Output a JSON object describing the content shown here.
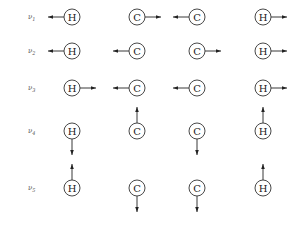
{
  "atoms": [
    "H",
    "C",
    "C",
    "H"
  ],
  "atom_x": [
    72,
    137,
    197,
    263
  ],
  "modes": [
    {
      "label": "ν1",
      "sub": "1",
      "y": 17,
      "displacements": [
        "left",
        "right",
        "left",
        "right"
      ]
    },
    {
      "label": "ν2",
      "sub": "2",
      "y": 51,
      "displacements": [
        "left",
        "left",
        "right",
        "right"
      ]
    },
    {
      "label": "ν3",
      "sub": "3",
      "y": 88,
      "displacements": [
        "right",
        "left",
        "left",
        "right"
      ]
    },
    {
      "label": "ν4",
      "sub": "4",
      "y": 131,
      "displacements": [
        "down",
        "up",
        "down",
        "up"
      ]
    },
    {
      "label": "ν5",
      "sub": "5",
      "y": 188,
      "displacements": [
        "up",
        "down",
        "down",
        "up"
      ]
    }
  ],
  "colors": {
    "stroke": "#222222",
    "label": "#555555"
  }
}
